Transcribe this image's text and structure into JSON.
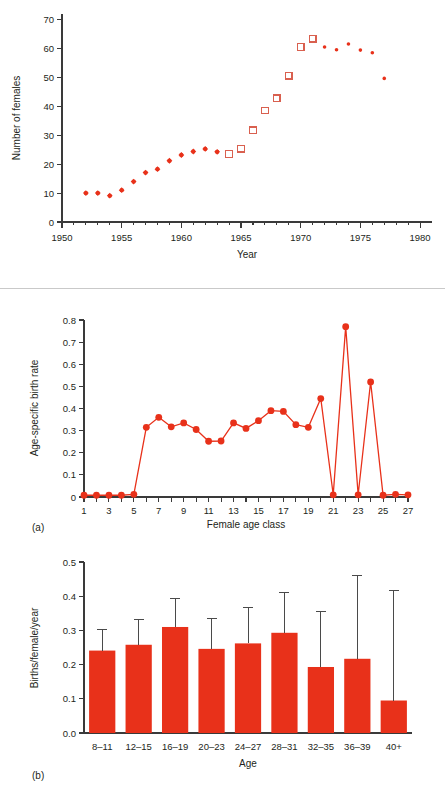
{
  "chart_data": [
    {
      "id": "population-trend",
      "type": "scatter",
      "title": "",
      "xlabel": "Year",
      "ylabel": "Number of females",
      "xlim": [
        1950,
        1981
      ],
      "ylim": [
        0,
        72
      ],
      "xticks": [
        1950,
        1955,
        1960,
        1965,
        1970,
        1975,
        1980
      ],
      "xticklabels": [
        "1950",
        "1955",
        "1960",
        "1965",
        "1970",
        "1975",
        "1980"
      ],
      "yticks": [
        0,
        10,
        20,
        30,
        40,
        50,
        60,
        70
      ],
      "yticklabels": [
        "0",
        "10",
        "20",
        "30",
        "40",
        "50",
        "60",
        "70"
      ],
      "grid": false,
      "legend": "none",
      "series": [
        {
          "name": "filled-diamond-estimates",
          "marker": "filled-diamond",
          "color": "#e8311a",
          "points": [
            {
              "x": 1952,
              "y": 10.0
            },
            {
              "x": 1953,
              "y": 10.0
            },
            {
              "x": 1954,
              "y": 9.1
            },
            {
              "x": 1955,
              "y": 11.0
            },
            {
              "x": 1956,
              "y": 14.0
            },
            {
              "x": 1957,
              "y": 17.1
            },
            {
              "x": 1958,
              "y": 18.3
            },
            {
              "x": 1959,
              "y": 21.2
            },
            {
              "x": 1960,
              "y": 23.2
            },
            {
              "x": 1961,
              "y": 24.4
            },
            {
              "x": 1962,
              "y": 25.3
            },
            {
              "x": 1963,
              "y": 24.3
            }
          ]
        },
        {
          "name": "open-square-counts",
          "marker": "open-square",
          "color": "#d9604f",
          "points": [
            {
              "x": 1964,
              "y": 23.5
            },
            {
              "x": 1965,
              "y": 25.4
            },
            {
              "x": 1966,
              "y": 31.7
            },
            {
              "x": 1967,
              "y": 38.6
            },
            {
              "x": 1968,
              "y": 42.8
            },
            {
              "x": 1969,
              "y": 50.6
            },
            {
              "x": 1970,
              "y": 60.6
            },
            {
              "x": 1971,
              "y": 63.5
            }
          ]
        },
        {
          "name": "small-dot-estimates",
          "marker": "small-dot",
          "color": "#e8311a",
          "points": [
            {
              "x": 1972,
              "y": 60.6
            },
            {
              "x": 1973,
              "y": 59.6
            },
            {
              "x": 1974,
              "y": 61.6
            },
            {
              "x": 1975,
              "y": 59.5
            },
            {
              "x": 1976,
              "y": 58.6
            },
            {
              "x": 1977,
              "y": 49.7
            }
          ]
        }
      ]
    },
    {
      "id": "age-specific-birth-rate",
      "type": "line",
      "panel_label": "(a)",
      "title": "",
      "xlabel": "Female age class",
      "ylabel": "Age-specific birth rate",
      "xlim": [
        1,
        27
      ],
      "ylim": [
        0,
        0.8
      ],
      "xticks": [
        1,
        2,
        3,
        4,
        5,
        6,
        7,
        8,
        9,
        10,
        11,
        12,
        13,
        14,
        15,
        16,
        17,
        18,
        19,
        20,
        21,
        22,
        23,
        24,
        25,
        26,
        27
      ],
      "xticklabels": [
        "1",
        "",
        "3",
        "",
        "5",
        "",
        "7",
        "",
        "9",
        "",
        "11",
        "",
        "13",
        "",
        "15",
        "",
        "17",
        "",
        "19",
        "",
        "21",
        "",
        "23",
        "",
        "25",
        "",
        "27"
      ],
      "yticks": [
        0,
        0.1,
        0.2,
        0.3,
        0.4,
        0.5,
        0.6,
        0.7,
        0.8
      ],
      "yticklabels": [
        "0",
        "0.1",
        "0.2",
        "0.3",
        "0.4",
        "0.5",
        "0.6",
        "0.7",
        "0.8"
      ],
      "grid": false,
      "legend": "none",
      "x": [
        1,
        2,
        3,
        4,
        5,
        6,
        7,
        8,
        9,
        10,
        11,
        12,
        13,
        14,
        15,
        16,
        17,
        18,
        19,
        20,
        21,
        22,
        23,
        24,
        25,
        26,
        27
      ],
      "values": [
        0.008,
        0.008,
        0.008,
        0.008,
        0.012,
        0.315,
        0.36,
        0.317,
        0.335,
        0.305,
        0.252,
        0.253,
        0.335,
        0.31,
        0.345,
        0.39,
        0.387,
        0.327,
        0.315,
        0.445,
        0.01,
        0.77,
        0.01,
        0.52,
        0.008,
        0.012,
        0.01
      ]
    },
    {
      "id": "births-per-female-per-year",
      "type": "bar",
      "panel_label": "(b)",
      "title": "",
      "xlabel": "Age",
      "ylabel": "Births/female/year",
      "ylim": [
        0.0,
        0.5
      ],
      "yticks": [
        0.0,
        0.1,
        0.2,
        0.3,
        0.4,
        0.5
      ],
      "yticklabels": [
        "0.0",
        "0.1",
        "0.2",
        "0.3",
        "0.4",
        "0.5"
      ],
      "grid": false,
      "legend": "none",
      "categories": [
        "8–11",
        "12–15",
        "16–19",
        "20–23",
        "24–27",
        "28–31",
        "32–35",
        "36–39",
        "40+"
      ],
      "values": [
        0.241,
        0.258,
        0.31,
        0.246,
        0.262,
        0.293,
        0.193,
        0.217,
        0.095
      ],
      "error_upper": [
        0.303,
        0.332,
        0.394,
        0.334,
        0.368,
        0.411,
        0.356,
        0.461,
        0.417
      ]
    }
  ]
}
